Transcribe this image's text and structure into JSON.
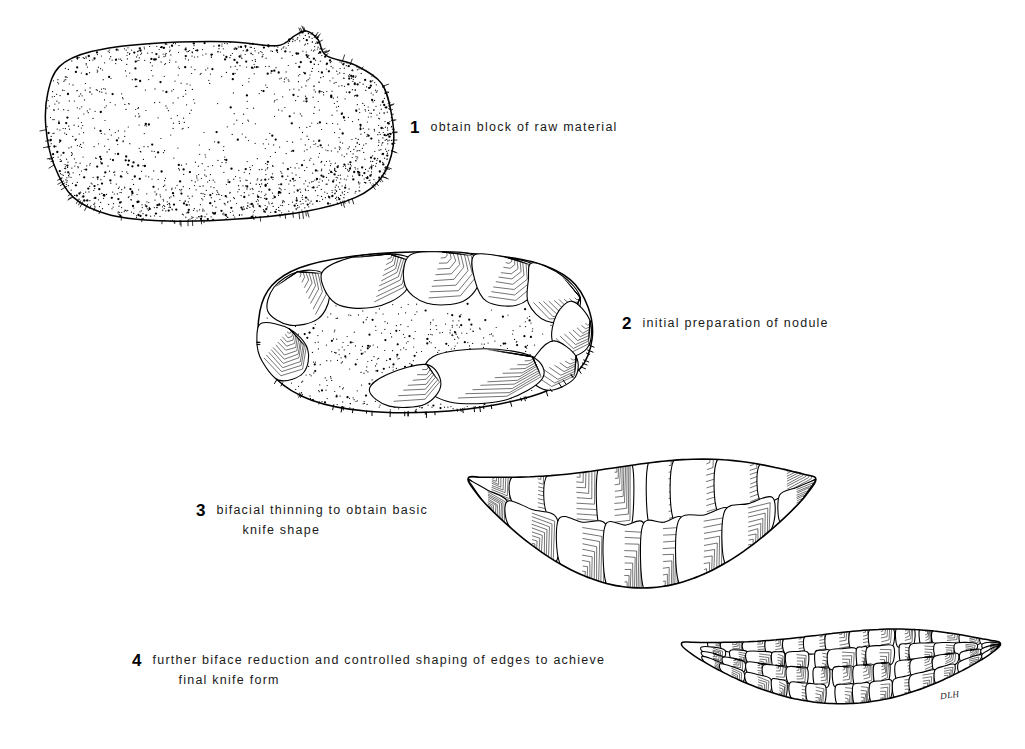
{
  "figure": {
    "background_color": "#ffffff",
    "ink_color": "#000000",
    "width": 1025,
    "height": 749,
    "signature": "DLH"
  },
  "stages": [
    {
      "number": "1",
      "caption_line1": "obtain block of raw material",
      "caption_line2": "",
      "object_name": "raw-stone-nodule",
      "description": "unworked cortical nodule with stippled cortex surface",
      "surface": "cortex",
      "flake_scar_count": 0,
      "caption_x": 410,
      "caption_y": 117,
      "art_x": 30,
      "art_y": 22,
      "art_w": 375,
      "art_h": 205
    },
    {
      "number": "2",
      "caption_line1": "initial preparation of nodule",
      "caption_line2": "",
      "object_name": "prepared-nodule",
      "description": "nodule with peripheral flake scars removed, cortex remaining at center",
      "surface": "partial cortex with flake scars",
      "flake_scar_count": 14,
      "caption_x": 622,
      "caption_y": 313,
      "art_x": 238,
      "art_y": 246,
      "art_w": 370,
      "art_h": 172
    },
    {
      "number": "3",
      "caption_line1": "bifacial thinning to obtain basic",
      "caption_line2": "knife shape",
      "object_name": "thinned-biface-preform",
      "description": "crescent shaped biface preform with large invasive thinning scars",
      "surface": "full flake scar coverage",
      "flake_scar_count": 22,
      "caption_x": 196,
      "caption_y": 500,
      "art_x": 462,
      "art_y": 444,
      "art_w": 360,
      "art_h": 150
    },
    {
      "number": "4",
      "caption_line1": "further biface reduction and controlled  shaping  of  edges  to  achieve",
      "caption_line2": "final knife form",
      "object_name": "finished-knife",
      "description": "finished crescentic knife with fine controlled edge retouch",
      "surface": "fine pressure flaking",
      "flake_scar_count": 48,
      "caption_x": 132,
      "caption_y": 650,
      "art_x": 676,
      "art_y": 618,
      "art_w": 330,
      "art_h": 110
    }
  ]
}
